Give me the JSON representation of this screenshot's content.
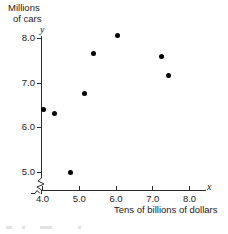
{
  "chart_data": {
    "type": "scatter",
    "title": "",
    "ylabel_lines": [
      "Millions",
      "of cars"
    ],
    "xlabel": "Tens of billions of dollars",
    "x_axis_variable": "x",
    "y_axis_variable": "y",
    "xticks": [
      "4.0",
      "5.0",
      "6.0",
      "7.0",
      "8.0"
    ],
    "xtick_values": [
      4.0,
      5.0,
      6.0,
      7.0,
      8.0
    ],
    "yticks": [
      "5.0",
      "6.0",
      "7.0",
      "8.0"
    ],
    "ytick_values": [
      5.0,
      6.0,
      7.0,
      8.0
    ],
    "xlim": [
      4.0,
      8.0
    ],
    "ylim": [
      5.0,
      8.0
    ],
    "grid": false,
    "legend": null,
    "axis_break": "y-axis broken below 5.0",
    "marker": "filled-circle",
    "marker_color": "#000000",
    "points": [
      {
        "x": 4.05,
        "y": 6.4
      },
      {
        "x": 4.35,
        "y": 6.3
      },
      {
        "x": 4.78,
        "y": 4.98
      },
      {
        "x": 5.15,
        "y": 6.75
      },
      {
        "x": 5.4,
        "y": 7.65
      },
      {
        "x": 6.05,
        "y": 8.05
      },
      {
        "x": 7.25,
        "y": 7.58
      },
      {
        "x": 7.45,
        "y": 7.15
      }
    ]
  }
}
